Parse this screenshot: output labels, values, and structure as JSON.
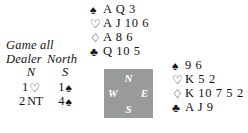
{
  "conditions": {
    "vulnerability": "Game all",
    "dealer_label": "Dealer",
    "dealer_value": "North"
  },
  "auction": {
    "headers": [
      "N",
      "S"
    ],
    "rows": [
      [
        {
          "level": "1",
          "suit": "♡",
          "suit_name": "hearts",
          "notrump": ""
        },
        {
          "level": "1",
          "suit": "♠",
          "suit_name": "spades",
          "notrump": ""
        }
      ],
      [
        {
          "level": "2",
          "suit": "",
          "suit_name": "notrump",
          "notrump": "NT"
        },
        {
          "level": "4",
          "suit": "♠",
          "suit_name": "spades",
          "notrump": ""
        }
      ]
    ]
  },
  "hands": {
    "north": {
      "position": "North",
      "suits": [
        {
          "symbol": "♠",
          "name": "spades",
          "cards": "A Q 3"
        },
        {
          "symbol": "♡",
          "name": "hearts",
          "cards": "A J 10 6"
        },
        {
          "symbol": "♢",
          "name": "diamonds",
          "cards": "A 8 6"
        },
        {
          "symbol": "♣",
          "name": "clubs",
          "cards": "Q 10 5"
        }
      ]
    },
    "east": {
      "position": "East",
      "suits": [
        {
          "symbol": "♠",
          "name": "spades",
          "cards": "9 6"
        },
        {
          "symbol": "♡",
          "name": "hearts",
          "cards": "K 5 2"
        },
        {
          "symbol": "♢",
          "name": "diamonds",
          "cards": "K 10 7 5 2"
        },
        {
          "symbol": "♣",
          "name": "clubs",
          "cards": "A J 9"
        }
      ]
    }
  },
  "compass": {
    "north": "N",
    "west": "W",
    "east": "E",
    "south": "S",
    "background": "#999b9a"
  }
}
